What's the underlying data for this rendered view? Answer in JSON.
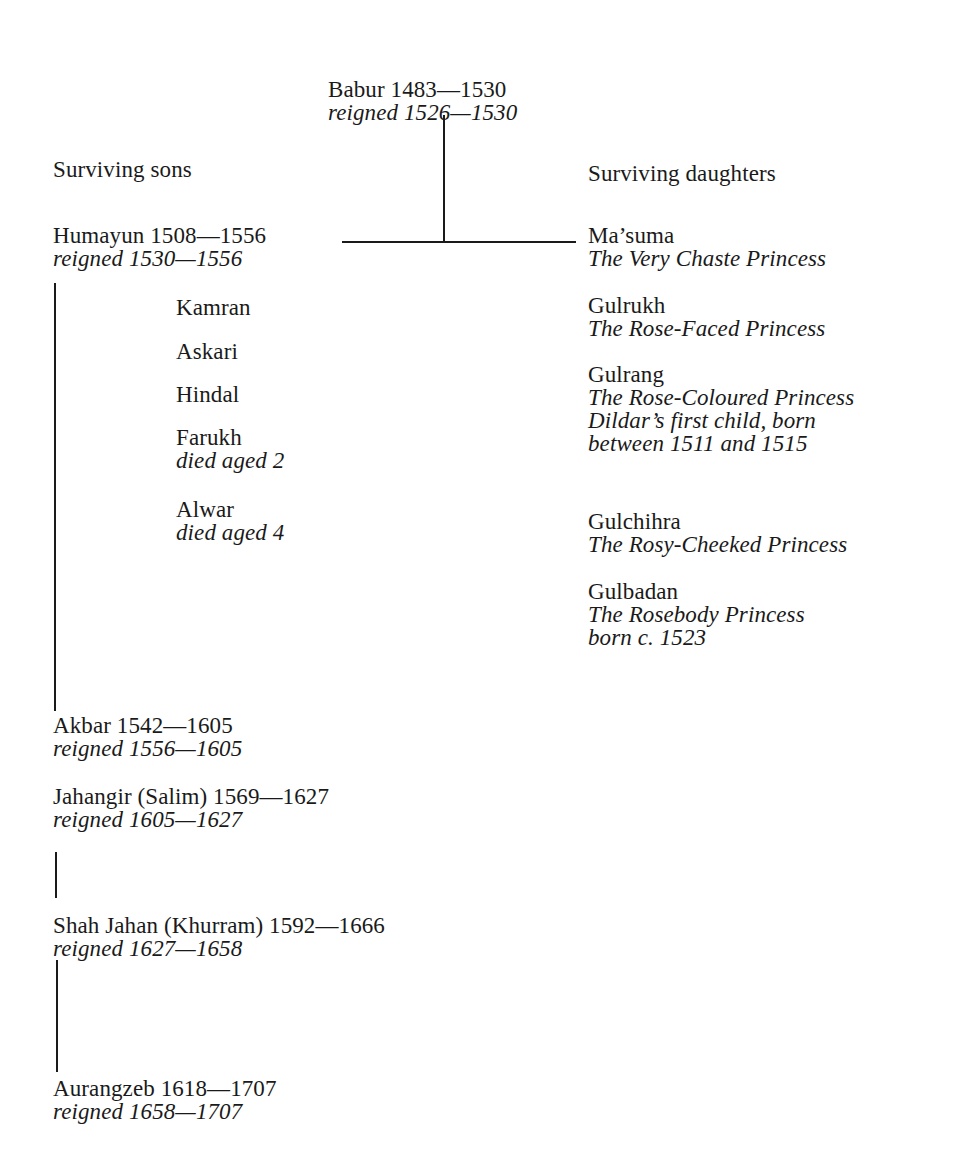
{
  "root": {
    "name": "Babur 1483—1530",
    "reign": "reigned 1526—1530"
  },
  "sons_heading": "Surviving sons",
  "daughters_heading": "Surviving daughters",
  "heir": {
    "name": "Humayun 1508—1556",
    "reign": "reigned 1530—1556"
  },
  "other_sons": [
    {
      "name": "Kamran"
    },
    {
      "name": "Askari"
    },
    {
      "name": "Hindal"
    },
    {
      "name": "Farukh",
      "note": "died aged 2"
    },
    {
      "name": "Alwar",
      "note": "died aged 4"
    }
  ],
  "daughters": [
    {
      "name": "Ma’suma",
      "title": "The Very Chaste Princess"
    },
    {
      "name": "Gulrukh",
      "title": "The Rose-Faced Princess"
    },
    {
      "name": "Gulrang",
      "title": "The Rose-Coloured Princess",
      "note1": "Dildar’s first child, born",
      "note2": "between 1511 and 1515"
    },
    {
      "name": "Gulchihra",
      "title": "The Rosy-Cheeked Princess"
    },
    {
      "name": "Gulbadan",
      "title": "The Rosebody Princess",
      "note1": "born c. 1523"
    }
  ],
  "successors": [
    {
      "name": "Akbar 1542—1605",
      "reign": "reigned 1556—1605"
    },
    {
      "name": "Jahangir (Salim) 1569—1627",
      "reign": "reigned 1605—1627"
    },
    {
      "name": "Shah Jahan (Khurram) 1592—1666",
      "reign": "reigned 1627—1658"
    },
    {
      "name": "Aurangzeb 1618—1707",
      "reign": "reigned 1658—1707"
    }
  ]
}
